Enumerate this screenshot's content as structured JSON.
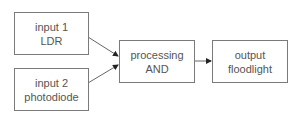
{
  "diagram": {
    "nodes": [
      {
        "id": "input1",
        "line1": "input 1",
        "line2": "LDR"
      },
      {
        "id": "input2",
        "line1": "input 2",
        "line2": "photodiode"
      },
      {
        "id": "processing",
        "line1": "processing",
        "line2": "AND"
      },
      {
        "id": "output",
        "line1": "output",
        "line2": "floodlight"
      }
    ],
    "edges": [
      {
        "from": "input1",
        "to": "processing"
      },
      {
        "from": "input2",
        "to": "processing"
      },
      {
        "from": "processing",
        "to": "output"
      }
    ],
    "colors": {
      "border": "#7a7a7a",
      "text": "#555555",
      "arrow": "#666666",
      "arrowhead": "#222222"
    }
  }
}
